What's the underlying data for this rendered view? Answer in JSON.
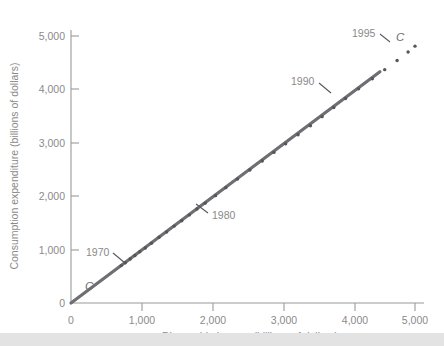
{
  "chart_data": {
    "type": "scatter",
    "title": "",
    "xlabel": "Disposable income (billions of dollars)",
    "ylabel": "Consumption expenditure (billions of dollars)",
    "xlim": [
      0,
      5000
    ],
    "ylim": [
      0,
      5000
    ],
    "xticks": [
      0,
      1000,
      2000,
      3000,
      4000,
      5000
    ],
    "yticks": [
      0,
      1000,
      2000,
      3000,
      4000,
      5000
    ],
    "xtick_labels": [
      "0",
      "1,000",
      "2,000",
      "3,000",
      "4,000",
      "5,000"
    ],
    "ytick_labels": [
      "0",
      "1,000",
      "2,000",
      "3,000",
      "4,000",
      "5,000"
    ],
    "grid": false,
    "legend": "none",
    "series": [
      {
        "name": "Consumption function C",
        "marker": "dot",
        "marker_color": "#55555a",
        "x": [
          730,
          790,
          860,
          930,
          1000,
          1080,
          1170,
          1280,
          1390,
          1500,
          1610,
          1720,
          1830,
          1950,
          2100,
          2250,
          2420,
          2600,
          2780,
          2950,
          3120,
          3300,
          3480,
          3650,
          3820,
          3990,
          4180,
          4380,
          4560,
          4740,
          4900,
          5000
        ],
        "y": [
          700,
          755,
          825,
          890,
          960,
          1030,
          1120,
          1230,
          1330,
          1440,
          1540,
          1650,
          1760,
          1870,
          2010,
          2160,
          2320,
          2490,
          2660,
          2820,
          2980,
          3150,
          3320,
          3490,
          3660,
          3830,
          4010,
          4200,
          4370,
          4540,
          4700,
          4810
        ]
      }
    ],
    "fit_line": {
      "name": "C",
      "color": "#6e6e73",
      "x_start": 0,
      "y_start": 0,
      "x_end": 4490,
      "y_end": 4330
    },
    "curve_labels": [
      {
        "text": "C",
        "x": 200,
        "y": 560
      },
      {
        "text": "C",
        "x": 4620,
        "y": 4400
      }
    ],
    "annotations": [
      {
        "label": "1970",
        "x": 730,
        "y": 700
      },
      {
        "label": "1980",
        "x": 1830,
        "y": 1760
      },
      {
        "label": "1990",
        "x": 3650,
        "y": 3490
      },
      {
        "label": "1995",
        "x": 4380,
        "y": 4200
      }
    ]
  },
  "axis": {
    "x_title": "Disposable income (billions of dollars)",
    "y_title": "Consumption expenditure (billions of dollars)"
  },
  "ticks": {
    "x": [
      "0",
      "1,000",
      "2,000",
      "3,000",
      "4,000",
      "5,000"
    ],
    "y": [
      "0",
      "1,000",
      "2,000",
      "3,000",
      "4,000",
      "5,000"
    ]
  },
  "annotations": {
    "a1970": "1970",
    "a1980": "1980",
    "a1990": "1990",
    "a1995": "1995"
  },
  "curve": {
    "origin_label": "C",
    "end_label": "C"
  }
}
